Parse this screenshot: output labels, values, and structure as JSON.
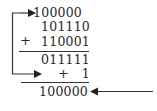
{
  "diagram": {
    "rows": {
      "carry_result": "100000",
      "operand_a": "101110",
      "operand_b": "110001",
      "partial_sum": "011111",
      "end_around_carry": "1",
      "final_result": "100000"
    },
    "operators": {
      "plus_1": "+",
      "plus_2": "+"
    },
    "arrows": [
      {
        "name": "end-around-carry-arrow",
        "description": "loop from top carry down to +1 row"
      },
      {
        "name": "result-pointer-arrow",
        "description": "points left at final result"
      }
    ],
    "colors": {
      "ink": "#2a2a2a",
      "background": "#ffffff"
    }
  }
}
